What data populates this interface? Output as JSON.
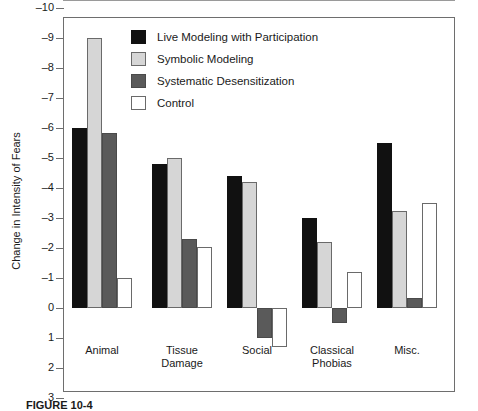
{
  "chart_data": {
    "type": "bar",
    "title": "",
    "xlabel": "",
    "ylabel": "Change in Intensity of Fears",
    "ylim": [
      3,
      -10.6
    ],
    "y_ticks": [
      -10,
      -9,
      -8,
      -7,
      -6,
      -5,
      -4,
      -3,
      -2,
      -1,
      0,
      1,
      2,
      3
    ],
    "y_tick_labels": [
      "–10",
      "–9",
      "–8",
      "–7",
      "–6",
      "–5",
      "–4",
      "–3",
      "–2",
      "–1",
      "0",
      "1",
      "2",
      "3"
    ],
    "y_axis_inverted": true,
    "grid": false,
    "legend_position": "top-center",
    "categories": [
      "Animal",
      "Tissue\nDamage",
      "Social",
      "Classical\nPhobias",
      "Misc."
    ],
    "category_labels": [
      {
        "line1": "Animal",
        "line2": ""
      },
      {
        "line1": "Tissue",
        "line2": "Damage"
      },
      {
        "line1": "Social",
        "line2": ""
      },
      {
        "line1": "Classical",
        "line2": "Phobias"
      },
      {
        "line1": "Misc.",
        "line2": ""
      }
    ],
    "series": [
      {
        "name": "Live Modeling with Participation",
        "color": "#111111",
        "values": [
          -6.0,
          -4.8,
          -4.4,
          -3.0,
          -5.5
        ]
      },
      {
        "name": "Symbolic Modeling",
        "color": "#d6d6d6",
        "values": [
          -9.0,
          -5.0,
          -4.2,
          -2.2,
          -3.25
        ]
      },
      {
        "name": "Systematic Desensitization",
        "color": "#5a5a5a",
        "values": [
          -5.85,
          -2.3,
          1.0,
          0.5,
          -0.35
        ]
      },
      {
        "name": "Control",
        "color": "#ffffff",
        "values": [
          -1.0,
          -2.05,
          1.3,
          -1.2,
          -3.5
        ]
      }
    ]
  },
  "legend": {
    "items": [
      {
        "label": "Live Modeling with Participation",
        "swatch": "s0"
      },
      {
        "label": "Symbolic Modeling",
        "swatch": "s1"
      },
      {
        "label": "Systematic Desensitization",
        "swatch": "s2"
      },
      {
        "label": "Control",
        "swatch": "s3"
      }
    ]
  },
  "caption": {
    "text": "FIGURE 10-4"
  }
}
